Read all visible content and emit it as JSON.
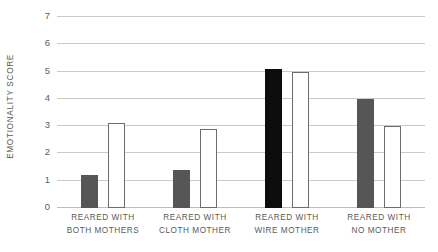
{
  "chart": {
    "type": "bar",
    "ylabel": "EMOTIONALITY SCORE",
    "y_ticks": [
      "0",
      "1",
      "2",
      "3",
      "4",
      "5",
      "6",
      "7"
    ],
    "groups": [
      {
        "line1": "REARED WITH",
        "line2": "BOTH MOTHERS"
      },
      {
        "line1": "REARED WITH",
        "line2": "CLOTH MOTHER"
      },
      {
        "line1": "REARED WITH",
        "line2": "WIRE MOTHER"
      },
      {
        "line1": "REARED WITH",
        "line2": "NO MOTHER"
      }
    ]
  },
  "chart_data": {
    "type": "bar",
    "title": "",
    "xlabel": "",
    "ylabel": "EMOTIONALITY SCORE",
    "ylim": [
      0,
      7
    ],
    "yticks": [
      0,
      1,
      2,
      3,
      4,
      5,
      6,
      7
    ],
    "grid": true,
    "legend": "none",
    "categories": [
      "REARED WITH BOTH MOTHERS",
      "REARED WITH CLOTH MOTHER",
      "REARED WITH WIRE MOTHER",
      "REARED WITH NO MOTHER"
    ],
    "series": [
      {
        "name": "filled bar",
        "style": "filled",
        "colors": [
          "#565656",
          "#565656",
          "#0d0d0d",
          "#565656"
        ],
        "values": [
          1.2,
          1.4,
          5.1,
          4.0
        ]
      },
      {
        "name": "open bar",
        "style": "open",
        "colors": [
          "#ffffff",
          "#ffffff",
          "#ffffff",
          "#ffffff"
        ],
        "values": [
          3.1,
          2.9,
          5.0,
          3.0
        ]
      }
    ]
  }
}
